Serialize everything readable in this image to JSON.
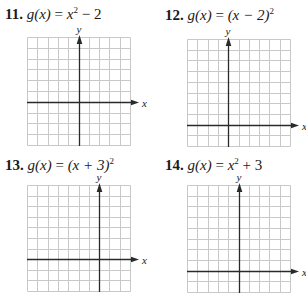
{
  "problems": [
    {
      "number": "11.",
      "lhs": "g(x)",
      "eq": "=",
      "rhs_parts": [
        "x",
        "2",
        " − 2"
      ],
      "rhs_text": "x^2 − 2",
      "grid": {
        "cols": 10,
        "rows": 10,
        "y_axis_col": 5,
        "x_axis_row": 6
      },
      "x_label": "x",
      "y_label": "y"
    },
    {
      "number": "12.",
      "lhs": "g(x)",
      "eq": "=",
      "rhs_parts": [
        "(x − 2)",
        "2",
        ""
      ],
      "rhs_text": "(x − 2)^2",
      "grid": {
        "cols": 10,
        "rows": 10,
        "y_axis_col": 4,
        "x_axis_row": 8
      },
      "x_label": "x",
      "y_label": "y"
    },
    {
      "number": "13.",
      "lhs": "g(x)",
      "eq": "=",
      "rhs_parts": [
        "(x + 3)",
        "2",
        ""
      ],
      "rhs_text": "(x + 3)^2",
      "grid": {
        "cols": 10,
        "rows": 10,
        "y_axis_col": 7,
        "x_axis_row": 7
      },
      "x_label": "x",
      "y_label": "y"
    },
    {
      "number": "14.",
      "lhs": "g(x)",
      "eq": "=",
      "rhs_parts": [
        "x",
        "2",
        " + 3"
      ],
      "rhs_text": "x^2 + 3",
      "grid": {
        "cols": 10,
        "rows": 10,
        "y_axis_col": 5,
        "x_axis_row": 8
      },
      "x_label": "x",
      "y_label": "y"
    }
  ],
  "colors": {
    "grid_line": "#c8c8c8",
    "axis": "#2a2a2a",
    "text": "#1a1a1a"
  }
}
